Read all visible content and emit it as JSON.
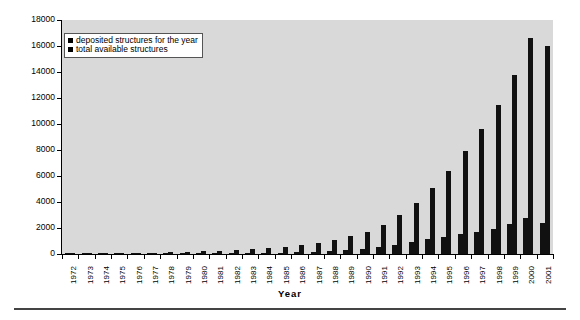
{
  "chart_data": {
    "type": "bar",
    "title": "",
    "subtitle": "",
    "xlabel": "Year",
    "ylabel": "",
    "ylim": [
      0,
      18000
    ],
    "ytick_step": 2000,
    "yticks": [
      0,
      2000,
      4000,
      6000,
      8000,
      10000,
      12000,
      14000,
      16000,
      18000
    ],
    "ytick_labels": [
      "0",
      "2000",
      "4000",
      "6000",
      "8000",
      "10000",
      "12000",
      "14000",
      "16000",
      "18000"
    ],
    "grid": false,
    "legend_position": "upper-left-inside",
    "categories": [
      "1972",
      "1973",
      "1974",
      "1975",
      "1976",
      "1977",
      "1978",
      "1979",
      "1980",
      "1981",
      "1982",
      "1983",
      "1984",
      "1985",
      "1986",
      "1987",
      "1988",
      "1989",
      "1990",
      "1991",
      "1992",
      "1993",
      "1994",
      "1995",
      "1996",
      "1997",
      "1998",
      "1999",
      "2000",
      "2001"
    ],
    "series": [
      {
        "name": "deposited structures for the year",
        "color": "#111111",
        "values": [
          7,
          9,
          12,
          13,
          23,
          26,
          25,
          31,
          36,
          47,
          51,
          64,
          79,
          104,
          131,
          186,
          202,
          295,
          369,
          538,
          727,
          928,
          1135,
          1330,
          1528,
          1670,
          1891,
          2330,
          2799,
          2386
        ]
      },
      {
        "name": "total available structures",
        "color": "#111111",
        "values": [
          22,
          31,
          43,
          56,
          79,
          105,
          130,
          161,
          197,
          244,
          295,
          359,
          438,
          542,
          673,
          859,
          1061,
          1356,
          1725,
          2263,
          2990,
          3918,
          5053,
          6383,
          7911,
          9581,
          11472,
          13802,
          16601,
          16000
        ]
      }
    ]
  },
  "axis": {
    "x_title": "Year"
  },
  "legend": {
    "entries": [
      {
        "label": "deposited structures for the year",
        "swatch": "legend-swatch-black"
      },
      {
        "label": "total available structures",
        "swatch": "legend-swatch-black"
      }
    ]
  },
  "colors": {
    "bar": "#111111",
    "plot_background": "#d9d9d9",
    "figure_background": "#ffffff",
    "axis": "#000000",
    "rule": "#444444"
  }
}
